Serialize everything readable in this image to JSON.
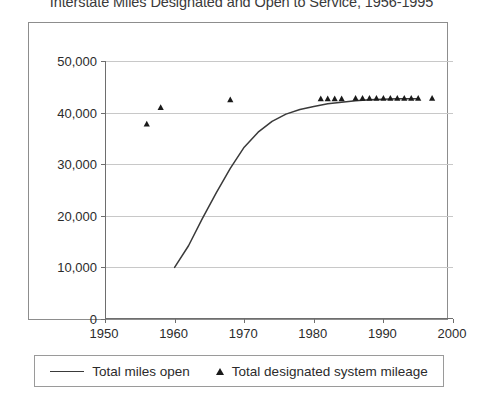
{
  "chart_data": {
    "type": "line",
    "title": "Interstate Miles Designated and Open to Service, 1956-1995",
    "xlabel": "",
    "ylabel": "",
    "xlim": [
      1950,
      2000
    ],
    "ylim": [
      0,
      50000
    ],
    "xticks": [
      1950,
      1960,
      1970,
      1980,
      1990,
      2000
    ],
    "xtick_labels": [
      "1950",
      "1960",
      "1970",
      "1980",
      "1990",
      "2000"
    ],
    "yticks": [
      0,
      10000,
      20000,
      30000,
      40000,
      50000
    ],
    "ytick_labels": [
      "0",
      "10,000",
      "20,000",
      "30,000",
      "40,000",
      "50,000"
    ],
    "grid": true,
    "grid_axis": "y",
    "legend_position": "bottom",
    "series": [
      {
        "name": "Total miles open",
        "type": "line",
        "marker": "none",
        "color": "#3a3a3a",
        "points": [
          [
            1960,
            10000
          ],
          [
            1962,
            14200
          ],
          [
            1964,
            19500
          ],
          [
            1966,
            24500
          ],
          [
            1968,
            29200
          ],
          [
            1970,
            33300
          ],
          [
            1972,
            36200
          ],
          [
            1974,
            38300
          ],
          [
            1976,
            39700
          ],
          [
            1978,
            40600
          ],
          [
            1980,
            41200
          ],
          [
            1982,
            41700
          ],
          [
            1984,
            42000
          ],
          [
            1986,
            42300
          ],
          [
            1988,
            42500
          ],
          [
            1990,
            42600
          ],
          [
            1992,
            42700
          ],
          [
            1994,
            42700
          ],
          [
            1995,
            42700
          ]
        ]
      },
      {
        "name": "Total designated system mileage",
        "type": "scatter",
        "marker": "triangle",
        "color": "#1a1a1a",
        "points": [
          [
            1956,
            37800
          ],
          [
            1958,
            41000
          ],
          [
            1968,
            42500
          ],
          [
            1981,
            42700
          ],
          [
            1982,
            42700
          ],
          [
            1983,
            42700
          ],
          [
            1984,
            42700
          ],
          [
            1986,
            42800
          ],
          [
            1987,
            42800
          ],
          [
            1988,
            42800
          ],
          [
            1989,
            42800
          ],
          [
            1990,
            42800
          ],
          [
            1991,
            42800
          ],
          [
            1992,
            42800
          ],
          [
            1993,
            42800
          ],
          [
            1994,
            42800
          ],
          [
            1995,
            42800
          ],
          [
            1997,
            42800
          ]
        ]
      }
    ],
    "legend": [
      {
        "label": "Total miles open",
        "marker": "line"
      },
      {
        "label": "Total designated system mileage",
        "marker": "triangle"
      }
    ]
  }
}
